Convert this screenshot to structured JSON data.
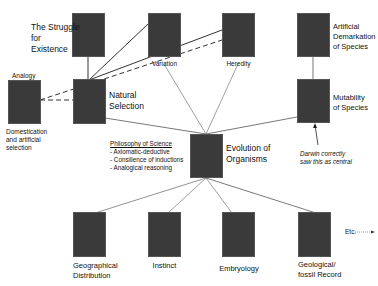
{
  "nodes": {
    "struggle": {
      "label_lines": [
        "The Struggle",
        "for",
        "Existence"
      ]
    },
    "variation": {
      "label": "Variation"
    },
    "heredity": {
      "label": "Heredity"
    },
    "artificial_demarkation": {
      "label_lines": [
        "Artificial",
        "Demarkation",
        "of Species"
      ]
    },
    "analogy": {
      "top_label": "Analogy",
      "label_lines": [
        "Domestication",
        "and artificial",
        "selection"
      ]
    },
    "natural_selection": {
      "label_lines": [
        "Natural",
        "Selection"
      ]
    },
    "mutability": {
      "label_lines": [
        "Mutability",
        "of Species"
      ]
    },
    "evolution": {
      "label_lines": [
        "Evolution of",
        "Organisms"
      ]
    },
    "geographical": {
      "label_lines": [
        "Geographical",
        "Distribution"
      ]
    },
    "instinct": {
      "label": "Instinct"
    },
    "embryology": {
      "label": "Embryology"
    },
    "geological": {
      "label_lines": [
        "Geological/",
        "fossil Record"
      ]
    }
  },
  "philosophy": {
    "title": "Philosophy of Science",
    "items": [
      "- Axiomatic-deductive",
      "- Consilience of inductions",
      "- Analogical reasoning"
    ]
  },
  "annotation": {
    "lines": [
      "Darwin correctly",
      "saw this as central"
    ]
  },
  "etc": {
    "label": "Etc."
  },
  "colors": {
    "box": "#3a3a3a",
    "line": "#333333",
    "background": "#ffffff"
  }
}
